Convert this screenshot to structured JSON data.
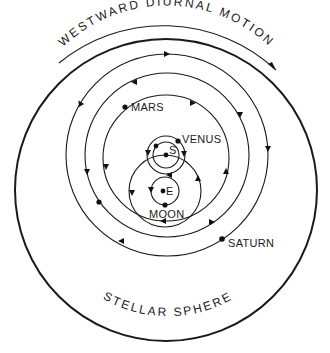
{
  "diagram": {
    "top_label": "WESTWARD DIURNAL MOTION",
    "bottom_label": "STELLAR SPHERE",
    "bodies": {
      "mars": "MARS",
      "venus": "VENUS",
      "sun": "S",
      "earth": "E",
      "moon": "MOON",
      "saturn": "SATURN"
    },
    "colors": {
      "ink": "#1a1a1a",
      "background": "#ffffff"
    }
  }
}
